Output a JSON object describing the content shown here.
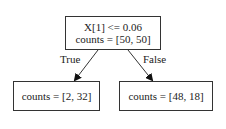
{
  "tree": {
    "root": {
      "condition": "X[1] <= 0.06",
      "counts": "counts = [50, 50]"
    },
    "left": {
      "edge_label": "True",
      "counts": "counts = [2, 32]"
    },
    "right": {
      "edge_label": "False",
      "counts": "counts = [48, 18]"
    }
  }
}
